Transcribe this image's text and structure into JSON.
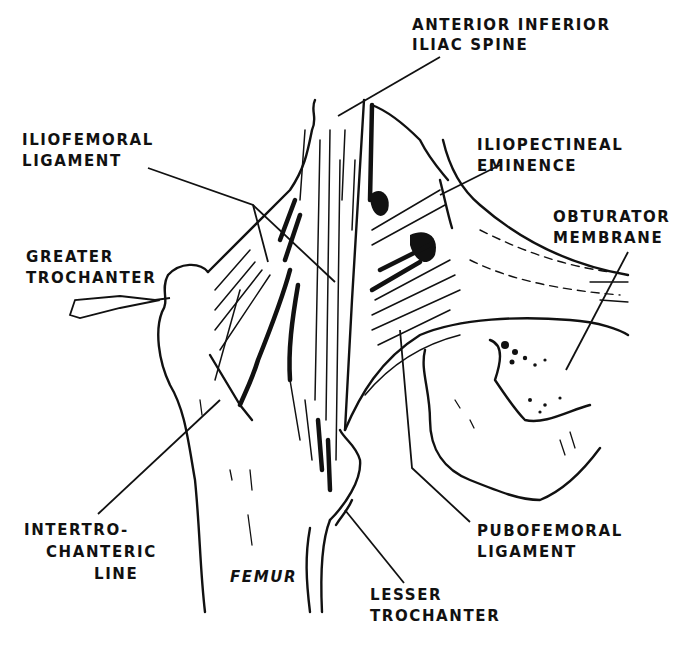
{
  "figure": {
    "background": "#ffffff",
    "ink": "#111111"
  },
  "labels": [
    {
      "id": "anterior-inferior-iliac-spine",
      "lines": [
        "ANTERIOR INFERIOR",
        "ILIAC SPINE"
      ],
      "x": 412,
      "y": 30,
      "anchor": "start",
      "line_gap": 20,
      "italic": false,
      "leader": [
        [
          440,
          57
        ],
        [
          338,
          116
        ]
      ]
    },
    {
      "id": "iliofemoral-ligament",
      "lines": [
        "ILIOFEMORAL",
        "LIGAMENT"
      ],
      "x": 22,
      "y": 145,
      "anchor": "start",
      "line_gap": 21,
      "italic": false,
      "leader": [
        [
          148,
          168
        ],
        [
          253,
          205
        ],
        [
          268,
          262
        ]
      ],
      "leader2": [
        [
          253,
          205
        ],
        [
          335,
          282
        ]
      ]
    },
    {
      "id": "greater-trochanter",
      "lines": [
        "GREATER",
        "TROCHANTER"
      ],
      "x": 26,
      "y": 262,
      "anchor": "start",
      "line_gap": 21,
      "italic": false,
      "leader": [
        [
          170,
          298
        ],
        [
          155,
          300
        ],
        [
          120,
          296
        ],
        [
          75,
          300
        ],
        [
          70,
          315
        ],
        [
          80,
          318
        ],
        [
          120,
          308
        ],
        [
          160,
          300
        ]
      ]
    },
    {
      "id": "iliopectineal-eminence",
      "lines": [
        "ILIOPECTINEAL",
        "EMINENCE"
      ],
      "x": 477,
      "y": 150,
      "anchor": "start",
      "line_gap": 21,
      "italic": false,
      "leader": [
        [
          500,
          165
        ],
        [
          440,
          195
        ]
      ]
    },
    {
      "id": "obturator-membrane",
      "lines": [
        "OBTURATOR",
        "MEMBRANE"
      ],
      "x": 553,
      "y": 222,
      "anchor": "start",
      "line_gap": 21,
      "italic": false,
      "leader": [
        [
          628,
          252
        ],
        [
          566,
          370
        ]
      ]
    },
    {
      "id": "intertrochanteric-line",
      "lines": [
        "INTERTRO-",
        "CHANTERIC",
        "LINE"
      ],
      "x": 24,
      "y": 535,
      "anchor": "start",
      "line_gap": 22,
      "italic": false,
      "indents": [
        0,
        22,
        70
      ],
      "leader": [
        [
          98,
          514
        ],
        [
          220,
          400
        ]
      ]
    },
    {
      "id": "femur",
      "lines": [
        "FEMUR"
      ],
      "x": 230,
      "y": 582,
      "anchor": "start",
      "line_gap": 20,
      "italic": true,
      "leader": []
    },
    {
      "id": "pubofemoral-ligament",
      "lines": [
        "PUBOFEMORAL",
        "LIGAMENT"
      ],
      "x": 477,
      "y": 536,
      "anchor": "start",
      "line_gap": 21,
      "italic": false,
      "leader": [
        [
          470,
          522
        ],
        [
          412,
          468
        ],
        [
          400,
          330
        ]
      ]
    },
    {
      "id": "lesser-trochanter",
      "lines": [
        "LESSER",
        "TROCHANTER"
      ],
      "x": 370,
      "y": 600,
      "anchor": "start",
      "line_gap": 21,
      "italic": false,
      "leader": [
        [
          404,
          583
        ],
        [
          345,
          510
        ]
      ]
    }
  ]
}
